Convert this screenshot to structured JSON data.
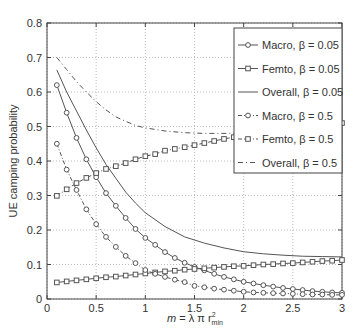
{
  "chart_data": {
    "type": "line",
    "title": "",
    "xlabel": "m = λ π r²_min",
    "xlabel_parts": {
      "m": "m",
      "eq": " = λ π r",
      "sup": "2",
      "sub": "min"
    },
    "ylabel": "UE camping probability",
    "xlim": [
      0,
      3
    ],
    "ylim": [
      0,
      0.8
    ],
    "grid": true,
    "legend_position": "upper right",
    "x_ticks": [
      "0",
      "0.5",
      "1",
      "1.5",
      "2",
      "2.5",
      "3"
    ],
    "y_ticks": [
      "0",
      "0.1",
      "0.2",
      "0.3",
      "0.4",
      "0.5",
      "0.6",
      "0.7",
      "0.8"
    ],
    "series": [
      {
        "name": "Macro, β = 0.05",
        "label": "Macro, ",
        "beta": "β = 0.05",
        "style": "solid",
        "marker": "circle",
        "x": [
          0.1,
          0.2,
          0.3,
          0.4,
          0.5,
          0.6,
          0.7,
          0.8,
          0.9,
          1.0,
          1.1,
          1.2,
          1.3,
          1.4,
          1.5,
          1.6,
          1.7,
          1.8,
          1.9,
          2.0,
          2.1,
          2.2,
          2.3,
          2.4,
          2.5,
          2.6,
          2.7,
          2.8,
          2.9,
          3.0
        ],
        "values": [
          0.62,
          0.54,
          0.467,
          0.405,
          0.353,
          0.307,
          0.27,
          0.235,
          0.203,
          0.177,
          0.157,
          0.136,
          0.119,
          0.105,
          0.093,
          0.083,
          0.073,
          0.064,
          0.057,
          0.05,
          0.045,
          0.04,
          0.036,
          0.032,
          0.029,
          0.026,
          0.023,
          0.021,
          0.019,
          0.018
        ]
      },
      {
        "name": "Femto, β = 0.05",
        "label": "Femto, ",
        "beta": "β = 0.05",
        "style": "solid",
        "marker": "square",
        "x": [
          0.1,
          0.2,
          0.3,
          0.4,
          0.5,
          0.6,
          0.7,
          0.8,
          0.9,
          1.0,
          1.1,
          1.2,
          1.3,
          1.4,
          1.5,
          1.6,
          1.7,
          1.8,
          1.9,
          2.0,
          2.1,
          2.2,
          2.3,
          2.4,
          2.5,
          2.6,
          2.7,
          2.8,
          2.9,
          3.0
        ],
        "values": [
          0.048,
          0.051,
          0.054,
          0.057,
          0.06,
          0.063,
          0.065,
          0.068,
          0.071,
          0.074,
          0.077,
          0.08,
          0.082,
          0.085,
          0.087,
          0.089,
          0.091,
          0.093,
          0.095,
          0.096,
          0.098,
          0.1,
          0.101,
          0.103,
          0.104,
          0.106,
          0.108,
          0.11,
          0.111,
          0.113
        ]
      },
      {
        "name": "Overall, β = 0.05",
        "label": "Overall, ",
        "beta": "β = 0.05",
        "style": "solid",
        "marker": "none",
        "x": [
          0.1,
          0.2,
          0.3,
          0.4,
          0.5,
          0.6,
          0.7,
          0.8,
          0.9,
          1.0,
          1.2,
          1.4,
          1.6,
          1.8,
          2.0,
          2.2,
          2.4,
          2.6,
          2.8,
          3.0
        ],
        "values": [
          0.664,
          0.6,
          0.545,
          0.49,
          0.438,
          0.39,
          0.35,
          0.31,
          0.278,
          0.25,
          0.21,
          0.18,
          0.162,
          0.148,
          0.137,
          0.131,
          0.127,
          0.124,
          0.123,
          0.122
        ]
      },
      {
        "name": "Macro, β = 0.5",
        "label": "Macro, ",
        "beta": "β = 0.5",
        "style": "dashdot",
        "marker": "circle",
        "x": [
          0.1,
          0.2,
          0.3,
          0.4,
          0.5,
          0.6,
          0.7,
          0.8,
          0.9,
          1.0,
          1.1,
          1.2,
          1.3,
          1.4,
          1.5,
          1.6,
          1.7,
          1.8,
          1.9,
          2.0,
          2.1,
          2.2,
          2.3,
          2.4,
          2.5,
          2.6,
          2.7,
          2.8,
          2.9,
          3.0
        ],
        "values": [
          0.45,
          0.375,
          0.316,
          0.26,
          0.217,
          0.18,
          0.151,
          0.125,
          0.104,
          0.084,
          0.073,
          0.064,
          0.056,
          0.049,
          0.038,
          0.034,
          0.03,
          0.027,
          0.024,
          0.021,
          0.019,
          0.018,
          0.017,
          0.016,
          0.015,
          0.014,
          0.013,
          0.013,
          0.012,
          0.012
        ]
      },
      {
        "name": "Femto, β = 0.5",
        "label": "Femto, ",
        "beta": "β = 0.5",
        "style": "dashdot",
        "marker": "square",
        "x": [
          0.1,
          0.2,
          0.3,
          0.4,
          0.5,
          0.6,
          0.7,
          0.8,
          0.9,
          1.0,
          1.1,
          1.2,
          1.3,
          1.4,
          1.5,
          1.6,
          1.7,
          1.8,
          1.9,
          2.0,
          2.1,
          2.2,
          2.3,
          2.4,
          2.5,
          2.6,
          2.7,
          2.8,
          2.9,
          3.0
        ],
        "values": [
          0.299,
          0.318,
          0.336,
          0.351,
          0.365,
          0.377,
          0.385,
          0.394,
          0.405,
          0.414,
          0.42,
          0.43,
          0.435,
          0.44,
          0.446,
          0.452,
          0.458,
          0.464,
          0.469,
          0.474,
          0.479,
          0.483,
          0.487,
          0.491,
          0.495,
          0.498,
          0.502,
          0.505,
          0.508,
          0.51
        ]
      },
      {
        "name": "Overall, β = 0.5",
        "label": "Overall, ",
        "beta": "β = 0.5",
        "style": "dashed",
        "marker": "none",
        "x": [
          0.1,
          0.2,
          0.3,
          0.4,
          0.5,
          0.6,
          0.7,
          0.8,
          0.9,
          1.0,
          1.2,
          1.4,
          1.6,
          1.8,
          2.0,
          2.2,
          2.4,
          2.6,
          2.8,
          3.0
        ],
        "values": [
          0.7,
          0.665,
          0.63,
          0.6,
          0.572,
          0.548,
          0.528,
          0.515,
          0.503,
          0.496,
          0.487,
          0.482,
          0.48,
          0.48,
          0.481,
          0.483,
          0.485,
          0.487,
          0.489,
          0.49
        ]
      }
    ]
  }
}
